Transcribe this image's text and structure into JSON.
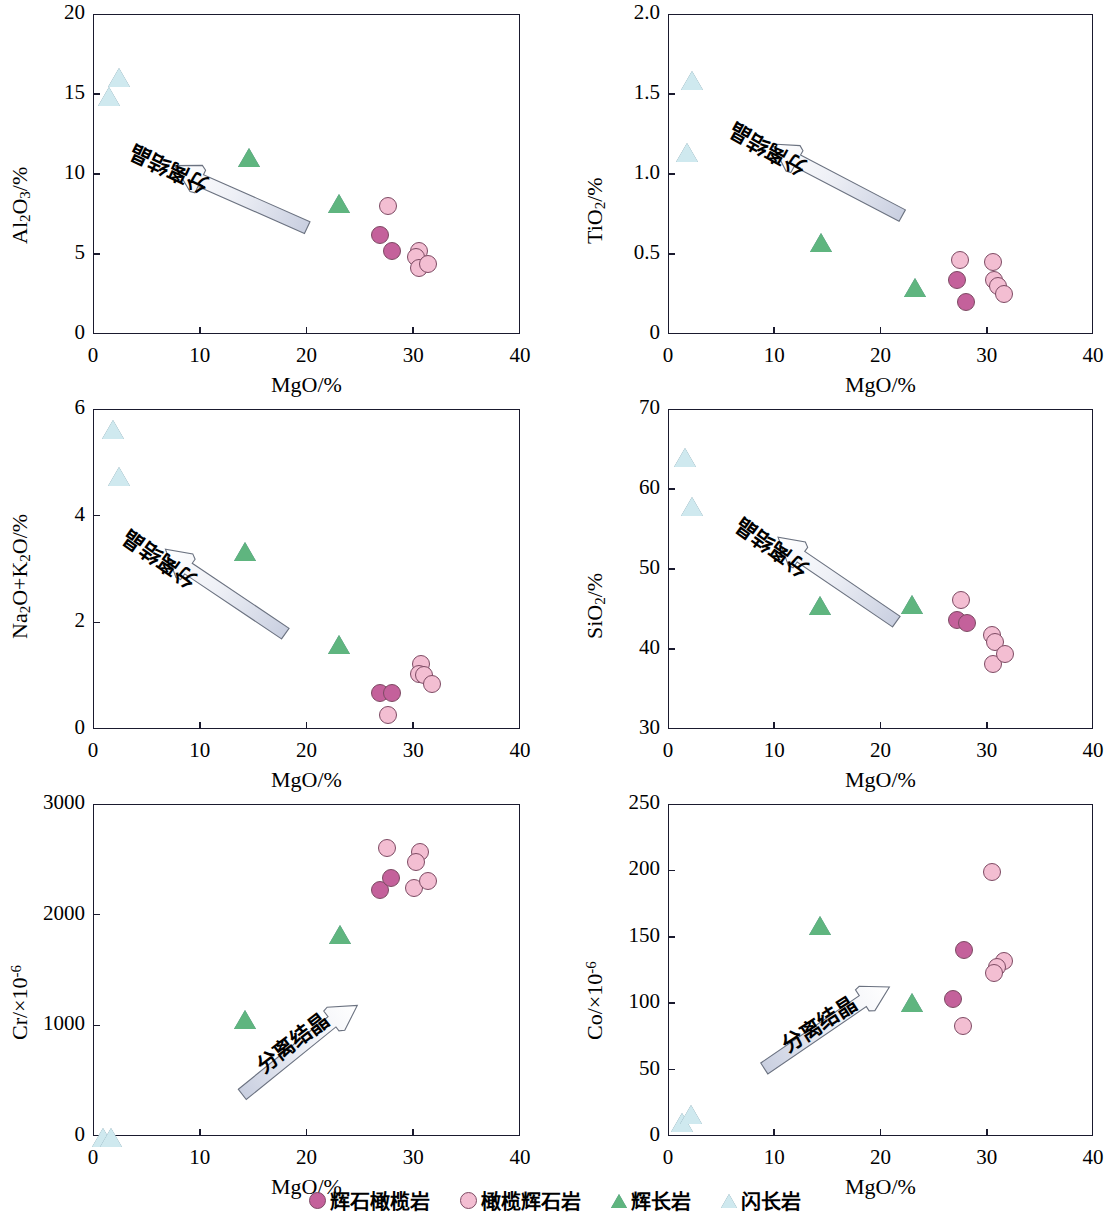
{
  "legend": {
    "items": [
      {
        "label": "辉石橄榄岩",
        "marker": "circle",
        "fill": "#C4619B",
        "name": "legend-item-pyroxene-peridotite"
      },
      {
        "label": "橄榄辉石岩",
        "marker": "circle",
        "fill": "#F3BED2",
        "name": "legend-item-olivine-pyroxenite"
      },
      {
        "label": "辉长岩",
        "marker": "triangle",
        "fill": "#5FB57F",
        "name": "legend-item-gabbro"
      },
      {
        "label": "闪长岩",
        "marker": "triangle",
        "fill": "#CFE9EF",
        "name": "legend-item-diorite"
      }
    ]
  },
  "annotation": {
    "text": "分离结晶"
  },
  "colors": {
    "pyroxene_peridotite": "#C4619B",
    "olivine_pyroxenite": "#F3BED2",
    "gabbro": "#5FB57F",
    "diorite": "#CFE9EF",
    "axis": "#1a1a2e"
  },
  "chart_data": [
    {
      "id": "panel-al2o3",
      "type": "scatter",
      "title": "",
      "xlabel": "MgO/%",
      "ylabel": "Al₂O₃/%",
      "ylabel_html": "Al<sub>2</sub>O<sub>3</sub>/%",
      "xlim": [
        0,
        40
      ],
      "ylim": [
        0,
        20
      ],
      "xticks": [
        0,
        10,
        20,
        30,
        40
      ],
      "yticks": [
        0,
        5,
        10,
        15,
        20
      ],
      "grid": false,
      "legend_position": "bottom-figure",
      "annotation": {
        "text": "分离结晶",
        "from": [
          20,
          6.6
        ],
        "to": [
          7.6,
          10.5
        ]
      },
      "series": [
        {
          "name": "辉石橄榄岩",
          "marker": "circle",
          "fill": "#C4619B",
          "points": [
            [
              26.9,
              6.2
            ],
            [
              28.0,
              5.2
            ]
          ]
        },
        {
          "name": "橄榄辉石岩",
          "marker": "circle",
          "fill": "#F3BED2",
          "points": [
            [
              27.6,
              8.0
            ],
            [
              30.5,
              5.2
            ],
            [
              30.3,
              4.8
            ],
            [
              30.5,
              4.1
            ],
            [
              31.4,
              4.4
            ]
          ]
        },
        {
          "name": "辉长岩",
          "marker": "triangle",
          "fill": "#5FB57F",
          "points": [
            [
              14.6,
              11.0
            ],
            [
              23.0,
              8.1
            ]
          ]
        },
        {
          "name": "闪长岩",
          "marker": "triangle",
          "fill": "#CFE9EF",
          "points": [
            [
              2.4,
              16.0
            ],
            [
              1.5,
              14.8
            ]
          ]
        }
      ]
    },
    {
      "id": "panel-tio2",
      "type": "scatter",
      "title": "",
      "xlabel": "MgO/%",
      "ylabel": "TiO₂/%",
      "ylabel_html": "TiO<sub>2</sub>/%",
      "xlim": [
        0,
        40
      ],
      "ylim": [
        0,
        2.0
      ],
      "xticks": [
        0,
        10,
        20,
        30,
        40
      ],
      "yticks": [
        0,
        0.5,
        1.0,
        1.5,
        2.0
      ],
      "ytick_labels": [
        "0",
        "0.5",
        "1.0",
        "1.5",
        "2.0"
      ],
      "grid": false,
      "annotation": {
        "text": "分离结晶",
        "from": [
          22.0,
          0.74
        ],
        "to": [
          9.8,
          1.19
        ]
      },
      "series": [
        {
          "name": "辉石橄榄岩",
          "marker": "circle",
          "fill": "#C4619B",
          "points": [
            [
              27.2,
              0.34
            ],
            [
              28.0,
              0.2
            ]
          ]
        },
        {
          "name": "橄榄辉石岩",
          "marker": "circle",
          "fill": "#F3BED2",
          "points": [
            [
              27.5,
              0.46
            ],
            [
              30.6,
              0.45
            ],
            [
              30.7,
              0.34
            ],
            [
              31.1,
              0.3
            ],
            [
              31.6,
              0.25
            ]
          ]
        },
        {
          "name": "辉长岩",
          "marker": "triangle",
          "fill": "#5FB57F",
          "points": [
            [
              14.4,
              0.57
            ],
            [
              23.2,
              0.29
            ]
          ]
        },
        {
          "name": "闪长岩",
          "marker": "triangle",
          "fill": "#CFE9EF",
          "points": [
            [
              2.3,
              1.58
            ],
            [
              1.8,
              1.13
            ]
          ]
        }
      ]
    },
    {
      "id": "panel-na2o-k2o",
      "type": "scatter",
      "title": "",
      "xlabel": "MgO/%",
      "ylabel": "Na₂O+K₂O/%",
      "ylabel_html": "Na<sub>2</sub>O+K<sub>2</sub>O/%",
      "xlim": [
        0,
        40
      ],
      "ylim": [
        0,
        6
      ],
      "xticks": [
        0,
        10,
        20,
        30,
        40
      ],
      "yticks": [
        0,
        2,
        4,
        6
      ],
      "grid": false,
      "annotation": {
        "text": "分离结晶",
        "from": [
          18.0,
          1.79
        ],
        "to": [
          6.8,
          3.38
        ]
      },
      "series": [
        {
          "name": "辉石橄榄岩",
          "marker": "circle",
          "fill": "#C4619B",
          "points": [
            [
              26.9,
              0.67
            ],
            [
              28.0,
              0.68
            ]
          ]
        },
        {
          "name": "橄榄辉石岩",
          "marker": "circle",
          "fill": "#F3BED2",
          "points": [
            [
              27.6,
              0.26
            ],
            [
              30.7,
              1.21
            ],
            [
              30.5,
              1.03
            ],
            [
              31.0,
              1.02
            ],
            [
              31.8,
              0.84
            ]
          ]
        },
        {
          "name": "辉长岩",
          "marker": "triangle",
          "fill": "#5FB57F",
          "points": [
            [
              14.2,
              3.32
            ],
            [
              23.0,
              1.58
            ]
          ]
        },
        {
          "name": "闪长岩",
          "marker": "triangle",
          "fill": "#CFE9EF",
          "points": [
            [
              1.9,
              5.6
            ],
            [
              2.4,
              4.73
            ]
          ]
        }
      ]
    },
    {
      "id": "panel-sio2",
      "type": "scatter",
      "title": "",
      "xlabel": "MgO/%",
      "ylabel": "SiO₂/%",
      "ylabel_html": "SiO<sub>2</sub>/%",
      "xlim": [
        0,
        40
      ],
      "ylim": [
        30,
        70
      ],
      "xticks": [
        0,
        10,
        20,
        30,
        40
      ],
      "yticks": [
        30,
        40,
        50,
        60,
        70
      ],
      "grid": false,
      "annotation": {
        "text": "分离结晶",
        "from": [
          21.5,
          43.4
        ],
        "to": [
          10.4,
          54.0
        ]
      },
      "series": [
        {
          "name": "辉石橄榄岩",
          "marker": "circle",
          "fill": "#C4619B",
          "points": [
            [
              27.2,
              43.6
            ],
            [
              28.1,
              43.3
            ]
          ]
        },
        {
          "name": "橄榄辉石岩",
          "marker": "circle",
          "fill": "#F3BED2",
          "points": [
            [
              27.6,
              46.1
            ],
            [
              30.5,
              41.8
            ],
            [
              30.8,
              40.9
            ],
            [
              30.6,
              38.1
            ],
            [
              31.7,
              39.4
            ]
          ]
        },
        {
          "name": "辉长岩",
          "marker": "triangle",
          "fill": "#5FB57F",
          "points": [
            [
              14.3,
              45.4
            ],
            [
              23.0,
              45.5
            ]
          ]
        },
        {
          "name": "闪长岩",
          "marker": "triangle",
          "fill": "#CFE9EF",
          "points": [
            [
              1.6,
              63.9
            ],
            [
              2.3,
              57.7
            ]
          ]
        }
      ]
    },
    {
      "id": "panel-cr",
      "type": "scatter",
      "title": "",
      "xlabel": "MgO/%",
      "ylabel": "Cr/×10⁻⁶",
      "ylabel_html": "Cr/×10<sup>-6</sup>",
      "xlim": [
        0,
        40
      ],
      "ylim": [
        0,
        3000
      ],
      "xticks": [
        0,
        10,
        20,
        30,
        40
      ],
      "yticks": [
        0,
        1000,
        2000,
        3000
      ],
      "grid": false,
      "annotation": {
        "text": "分离结晶",
        "from": [
          14.0,
          380
        ],
        "to": [
          24.8,
          1180
        ]
      },
      "series": [
        {
          "name": "辉石橄榄岩",
          "marker": "circle",
          "fill": "#C4619B",
          "points": [
            [
              26.9,
              2225
            ],
            [
              27.9,
              2335
            ]
          ]
        },
        {
          "name": "橄榄辉石岩",
          "marker": "circle",
          "fill": "#F3BED2",
          "points": [
            [
              27.5,
              2600
            ],
            [
              30.6,
              2565
            ],
            [
              30.3,
              2480
            ],
            [
              30.1,
              2245
            ],
            [
              31.4,
              2305
            ]
          ]
        },
        {
          "name": "辉长岩",
          "marker": "triangle",
          "fill": "#5FB57F",
          "points": [
            [
              14.2,
              1045
            ],
            "",
            [
              23.1,
              1815
            ]
          ]
        },
        {
          "name": "闪长岩",
          "marker": "triangle",
          "fill": "#CFE9EF",
          "points": [
            [
              0.9,
              -20
            ],
            [
              1.7,
              -20
            ]
          ]
        }
      ]
    },
    {
      "id": "panel-co",
      "type": "scatter",
      "title": "",
      "xlabel": "MgO/%",
      "ylabel": "Co/×10⁻⁶",
      "ylabel_html": "Co/×10<sup>-6</sup>",
      "xlim": [
        0,
        40
      ],
      "ylim": [
        0,
        250
      ],
      "xticks": [
        0,
        10,
        20,
        30,
        40
      ],
      "yticks": [
        0,
        50,
        100,
        150,
        200,
        250
      ],
      "grid": false,
      "annotation": {
        "text": "分离结晶",
        "from": [
          9.0,
          51
        ],
        "to": [
          20.8,
          112
        ]
      },
      "series": [
        {
          "name": "辉石橄榄岩",
          "marker": "circle",
          "fill": "#C4619B",
          "points": [
            [
              27.9,
              140
            ],
            [
              26.8,
              103
            ]
          ]
        },
        {
          "name": "橄榄辉石岩",
          "marker": "circle",
          "fill": "#F3BED2",
          "points": [
            [
              30.5,
              199
            ],
            [
              31.6,
              132
            ],
            [
              31.0,
              127
            ],
            [
              30.7,
              123
            ],
            [
              27.8,
              83
            ]
          ]
        },
        {
          "name": "辉长岩",
          "marker": "triangle",
          "fill": "#5FB57F",
          "points": [
            [
              14.3,
              158
            ],
            [
              23.0,
              100
            ]
          ]
        },
        {
          "name": "闪长岩",
          "marker": "triangle",
          "fill": "#CFE9EF",
          "points": [
            [
              1.3,
              10
            ],
            [
              2.2,
              16
            ]
          ]
        }
      ]
    }
  ]
}
